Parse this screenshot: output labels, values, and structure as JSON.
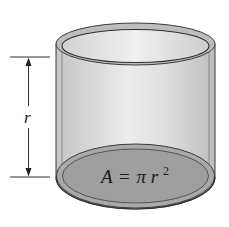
{
  "figure": {
    "dimension_label": "r",
    "formula": {
      "lhs": "A",
      "equals": "=",
      "pi": "π",
      "var": "r",
      "exponent": "2"
    }
  },
  "colors": {
    "background": "#ffffff",
    "wall": "#cfcfcf",
    "wall_highlight": "#e9e9e9",
    "rim": "#bdbdbd",
    "base_outer": "#a9a9a9",
    "base_inner": "#9c9c9c",
    "outline": "#3a3a3a",
    "dimension_line": "#333333"
  }
}
